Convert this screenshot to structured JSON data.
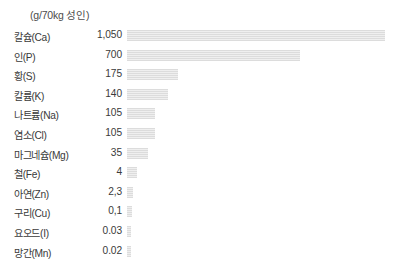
{
  "chart": {
    "title": "(g/70kg 성인)",
    "bar_color": "#e0e0e0",
    "background_color": "#ffffff",
    "text_color": "#3a3a3a"
  },
  "chart_data": {
    "type": "bar",
    "orientation": "horizontal",
    "title": "(g/70kg 성인)",
    "xlabel": "",
    "ylabel": "",
    "unit": "g/70kg 성인",
    "grid": false,
    "legend": "none",
    "axis_visible": false,
    "value_labels_shown": true,
    "categories": [
      "칼슘(Ca)",
      "인(P)",
      "황(S)",
      "칼륨(K)",
      "나트륨(Na)",
      "염소(Cl)",
      "마그네슘(Mg)",
      "철(Fe)",
      "아연(Zn)",
      "구리(Cu)",
      "요오드(I)",
      "망간(Mn)"
    ],
    "values": [
      1050,
      700,
      175,
      140,
      105,
      105,
      35,
      4,
      2.3,
      0.1,
      0.03,
      0.02
    ],
    "value_labels": [
      "1,050",
      "700",
      "175",
      "140",
      "105",
      "105",
      "35",
      "4",
      "2,3",
      "0,1",
      "0.03",
      "0.02"
    ],
    "bar_pixel_widths": [
      258,
      173,
      51,
      41,
      28,
      28,
      21,
      10,
      6,
      5,
      4,
      4
    ]
  },
  "rows": [
    {
      "label": "칼슘(Ca)",
      "value": "1,050",
      "bar_width": "258px"
    },
    {
      "label": "인(P)",
      "value": "700",
      "bar_width": "173px"
    },
    {
      "label": "황(S)",
      "value": "175",
      "bar_width": "51px"
    },
    {
      "label": "칼륨(K)",
      "value": "140",
      "bar_width": "41px"
    },
    {
      "label": "나트륨(Na)",
      "value": "105",
      "bar_width": "28px"
    },
    {
      "label": "염소(Cl)",
      "value": "105",
      "bar_width": "28px"
    },
    {
      "label": "마그네슘(Mg)",
      "value": "35",
      "bar_width": "21px"
    },
    {
      "label": "철(Fe)",
      "value": "4",
      "bar_width": "10px"
    },
    {
      "label": "아연(Zn)",
      "value": "2,3",
      "bar_width": "6px"
    },
    {
      "label": "구리(Cu)",
      "value": "0,1",
      "bar_width": "5px"
    },
    {
      "label": "요오드(I)",
      "value": "0.03",
      "bar_width": "4px"
    },
    {
      "label": "망간(Mn)",
      "value": "0.02",
      "bar_width": "4px"
    }
  ]
}
